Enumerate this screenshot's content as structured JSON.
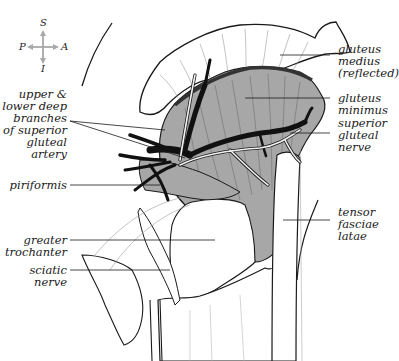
{
  "figure": {
    "colors": {
      "muscle_fill": "#a7a7a7",
      "artery": "#111111",
      "nerve": "#f2f2f2",
      "outline": "#1a1a1a",
      "compass_arrow": "#a8a8a8",
      "background": "#ffffff"
    }
  },
  "compass": {
    "superior": "S",
    "inferior": "I",
    "posterior": "P",
    "anterior": "A"
  },
  "labels": {
    "left": [
      {
        "id": "deep-branches",
        "lines": [
          "upper &",
          "lower deep",
          "branches",
          "of superior",
          "gluteal",
          "artery"
        ]
      },
      {
        "id": "piriformis",
        "lines": [
          "piriformis"
        ]
      },
      {
        "id": "greater-trochanter",
        "lines": [
          "greater",
          "trochanter"
        ]
      },
      {
        "id": "sciatic-nerve",
        "lines": [
          "sciatic",
          "nerve"
        ]
      }
    ],
    "right": [
      {
        "id": "gluteus-medius",
        "lines": [
          "gluteus",
          "medius",
          "(reflected)"
        ]
      },
      {
        "id": "gluteus-minimus",
        "lines": [
          "gluteus",
          "minimus"
        ]
      },
      {
        "id": "superior-gluteal-nerve",
        "lines": [
          "superior",
          "gluteal",
          "nerve"
        ]
      },
      {
        "id": "tensor-fasciae-latae",
        "lines": [
          "tensor",
          "fasciae",
          "latae"
        ]
      }
    ]
  }
}
